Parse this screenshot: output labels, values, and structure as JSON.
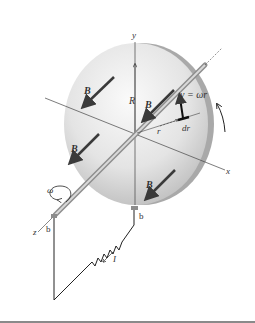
{
  "figure": {
    "axes": {
      "x": "x",
      "y": "y",
      "z": "z"
    },
    "labels": {
      "B": "B",
      "radius": "R",
      "radial": "r",
      "element": "dr",
      "velocity": "v = ωr",
      "omega": "ω",
      "current": "I",
      "brush_axle": "b",
      "brush_rim": "b"
    },
    "colors": {
      "disk_light": "#f2f2f2",
      "disk_dark": "#bdbdbd",
      "rim": "#a9a9a9",
      "arrow": "#3a3a3a",
      "wire": "#222222",
      "brush": "#8c8c8c",
      "rule": "#8a8a8a"
    }
  }
}
